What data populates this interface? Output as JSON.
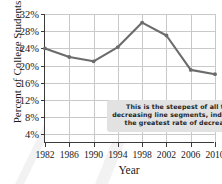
{
  "chart_data": {
    "type": "line",
    "title": "",
    "xlabel": "Year",
    "ylabel": "Percent of College Students",
    "categories": [
      "1982",
      "1986",
      "1990",
      "1994",
      "1998",
      "2002",
      "2006",
      "2010"
    ],
    "x": [
      1982,
      1986,
      1990,
      1994,
      1998,
      2002,
      2006,
      2010
    ],
    "values": [
      24,
      22,
      21,
      24.3,
      30,
      27,
      19,
      18
    ],
    "series": [
      {
        "name": "Percent of College Students",
        "values": [
          24,
          22,
          21,
          24.3,
          30,
          27,
          19,
          18
        ]
      }
    ],
    "ylim": [
      2,
      32
    ],
    "xlim": [
      1982,
      2010
    ],
    "ytick_labels": [
      "4%",
      "8%",
      "12%",
      "16%",
      "20%",
      "24%",
      "28%",
      "32%"
    ],
    "ytick_values": [
      4,
      8,
      12,
      16,
      20,
      24,
      28,
      32
    ],
    "grid": true,
    "legend": false,
    "series_color": "#6b6b6b",
    "grid_color": "#c9c9c9",
    "axis_color": "#3a3a3a",
    "annotations": [
      {
        "name": "steepest-segment-callout",
        "lines": [
          "This is the steepest of all the",
          "decreasing line segments, indicating",
          "the greatest rate of decrease."
        ],
        "background": "#e2e2e2"
      }
    ]
  }
}
